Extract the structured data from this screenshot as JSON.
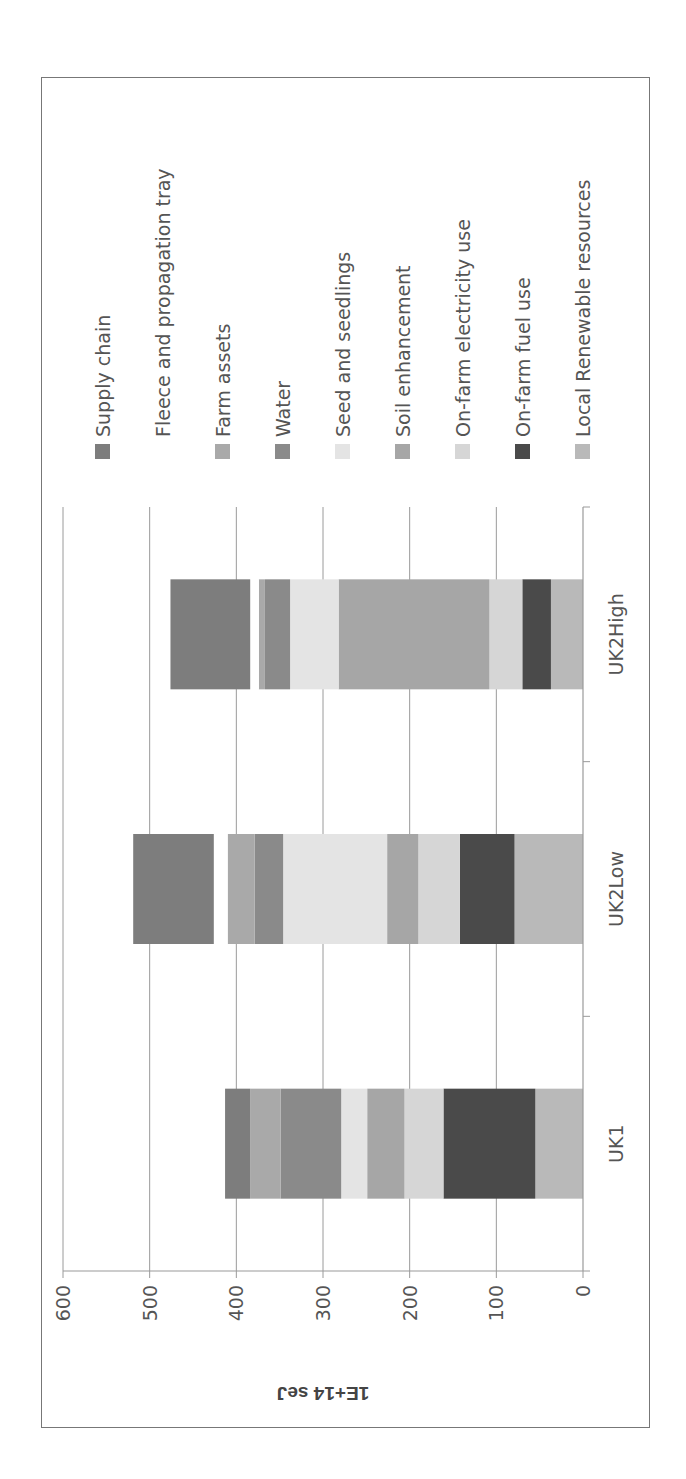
{
  "chart_data": {
    "type": "bar",
    "stacked": true,
    "orientation": "vertical (figure rotated 90° on page)",
    "title": "",
    "xlabel": "",
    "ylabel": "1E+14 seJ",
    "ylim": [
      0,
      600
    ],
    "yticks": [
      0,
      100,
      200,
      300,
      400,
      500,
      600
    ],
    "grid": true,
    "legend_position": "right",
    "categories": [
      "UK1",
      "UK2Low",
      "UK2High"
    ],
    "series": [
      {
        "name": "Local Renewable resources",
        "color": "#b9b9b9",
        "values": [
          55,
          79,
          37
        ]
      },
      {
        "name": "On-farm fuel use",
        "color": "#4a4a4a",
        "values": [
          106,
          63,
          33
        ]
      },
      {
        "name": "On-farm electricity use",
        "color": "#d6d6d6",
        "values": [
          45,
          48,
          38
        ]
      },
      {
        "name": "Soil enhancement",
        "color": "#a6a6a6",
        "values": [
          43,
          36,
          174
        ]
      },
      {
        "name": "Seed and seedlings",
        "color": "#e4e4e4",
        "values": [
          30,
          120,
          56
        ]
      },
      {
        "name": "Water",
        "color": "#8a8a8a",
        "values": [
          70,
          33,
          29
        ]
      },
      {
        "name": "Farm assets",
        "color": "#a9a9a9",
        "values": [
          35,
          31,
          7
        ]
      },
      {
        "name": "Fleece and propagation tray",
        "color": "#ffffff",
        "values": [
          0,
          16,
          10
        ]
      },
      {
        "name": "Supply chain",
        "color": "#7d7d7d",
        "values": [
          29,
          93,
          92
        ]
      }
    ],
    "totals": [
      413,
      519,
      476
    ]
  },
  "legend": {
    "items": [
      {
        "label": "Supply chain",
        "color": "#7d7d7d"
      },
      {
        "label": "Fleece and propagation tray",
        "color": "#ffffff"
      },
      {
        "label": "Farm assets",
        "color": "#a9a9a9"
      },
      {
        "label": "Water",
        "color": "#8a8a8a"
      },
      {
        "label": "Seed and seedlings",
        "color": "#e4e4e4"
      },
      {
        "label": "Soil enhancement",
        "color": "#a6a6a6"
      },
      {
        "label": "On-farm electricity use",
        "color": "#d6d6d6"
      },
      {
        "label": "On-farm fuel use",
        "color": "#4a4a4a"
      },
      {
        "label": "Local Renewable resources",
        "color": "#b9b9b9"
      }
    ]
  },
  "axis": {
    "y_title": "1E+14 seJ",
    "y_ticks": [
      "0",
      "100",
      "200",
      "300",
      "400",
      "500",
      "600"
    ],
    "categories": [
      "UK1",
      "UK2Low",
      "UK2High"
    ]
  }
}
